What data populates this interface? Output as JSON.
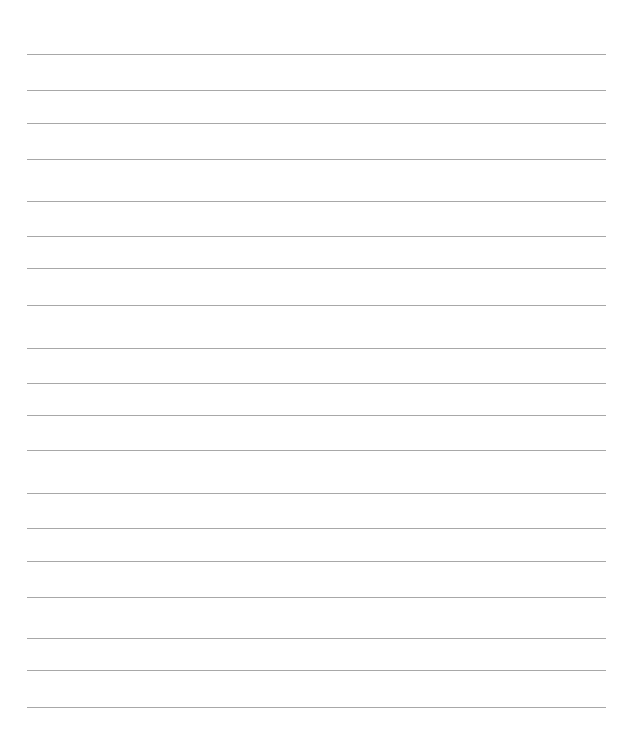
{
  "page": {
    "type": "lined-paper",
    "background": "#ffffff",
    "line_color": "#a8a8a8",
    "line_left": 27,
    "line_right": 606,
    "lines_y": [
      54,
      90,
      123,
      159,
      201,
      236,
      268,
      305,
      348,
      383,
      415,
      450,
      493,
      528,
      561,
      597,
      638,
      670,
      707
    ]
  }
}
